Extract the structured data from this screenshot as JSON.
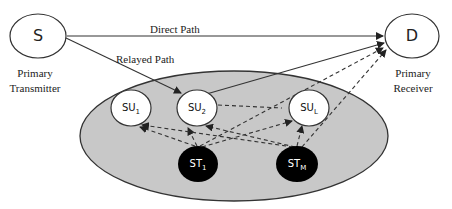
{
  "nodes": {
    "source": {
      "label": "S",
      "caption_line1": "Primary",
      "caption_line2": "Transmitter"
    },
    "destination": {
      "label": "D",
      "caption_line1": "Primary",
      "caption_line2": "Receiver"
    },
    "su1": {
      "label": "SU",
      "sub": "1"
    },
    "su2": {
      "label": "SU",
      "sub": "2"
    },
    "suL": {
      "label": "SU",
      "sub": "L"
    },
    "st1": {
      "label": "ST",
      "sub": "1"
    },
    "stM": {
      "label": "ST",
      "sub": "M"
    }
  },
  "edges": {
    "direct_path_label": "Direct Path",
    "relayed_path_label": "Relayed Path"
  },
  "colors": {
    "secondary_network_fill": "#c8c8c8",
    "secondary_transmitter_fill": "#000000",
    "secondary_user_fill": "#ffffff",
    "line": "#333333"
  }
}
